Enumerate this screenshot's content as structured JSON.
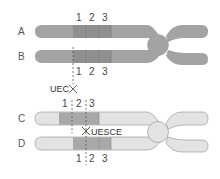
{
  "diagram": {
    "colors": {
      "dark_chromosome": "#a3a3a3",
      "dark_band": "#8c8c8c",
      "light_chromosome": "#e3e3e3",
      "light_band": "#a8a8a8",
      "outline": "#8a8a8a",
      "text": "#444444"
    },
    "chromosomes": [
      {
        "id": "A",
        "label": "A",
        "shade": "dark"
      },
      {
        "id": "B",
        "label": "B",
        "shade": "dark"
      },
      {
        "id": "C",
        "label": "C",
        "shade": "light"
      },
      {
        "id": "D",
        "label": "D",
        "shade": "light"
      }
    ],
    "band_labels_top": [
      "1",
      "2",
      "3"
    ],
    "band_labels_mid_upper": [
      "1",
      "2",
      "3"
    ],
    "band_labels_mid_lower": [
      "1",
      "2",
      "3"
    ],
    "band_labels_bottom": [
      "1",
      "2",
      "3"
    ],
    "annotations": {
      "uec": "UEC",
      "uesce": "UESCE",
      "cross_icon": "✕"
    }
  }
}
